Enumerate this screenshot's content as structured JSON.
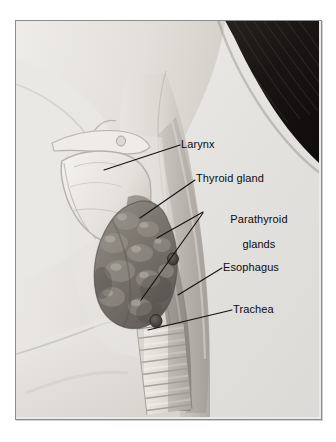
{
  "figure": {
    "kind": "anatomical-illustration",
    "orientation": "profile facing left",
    "style": "grayscale medical illustration",
    "frame": {
      "border_color": "#8a8c8e",
      "background": "#e9eaea"
    },
    "page_background": "#ffffff"
  },
  "palette": {
    "skin_light": "#e6e4e0",
    "skin_mid": "#cfccc6",
    "skin_shadow": "#a8a49d",
    "hair_dark": "#1d1a18",
    "hair_mid": "#3b3531",
    "larynx_light": "#e9e7e2",
    "thyroid_dark": "#6f6a65",
    "thyroid_mid": "#8a857f",
    "trachea_light": "#ddd9d3",
    "esophagus": "#9a958e",
    "leader_line": "#111111",
    "label_text": "#0b0b0b"
  },
  "labels": [
    {
      "id": "larynx",
      "text": "Larynx",
      "lines": [
        "Larynx"
      ],
      "x": 181,
      "y": 138,
      "align": "left",
      "leader": {
        "from": [
          180,
          145
        ],
        "to": [
          104,
          170
        ]
      }
    },
    {
      "id": "thyroid",
      "text": "Thyroid gland",
      "lines": [
        "Thyroid gland"
      ],
      "x": 196,
      "y": 172,
      "align": "left",
      "leader": {
        "from": [
          195,
          180
        ],
        "to": [
          140,
          218
        ]
      }
    },
    {
      "id": "parathyroid",
      "text": "Parathyroid glands",
      "lines": [
        "Parathyroid",
        "glands"
      ],
      "x": 205,
      "y": 200,
      "align": "left",
      "leader": {
        "from": [
          203,
          212
        ],
        "to": [
          157,
          238
        ]
      },
      "leader2": {
        "from": [
          203,
          213
        ],
        "to": [
          141,
          300
        ]
      }
    },
    {
      "id": "esophagus",
      "text": "Esophagus",
      "lines": [
        "Esophagus"
      ],
      "x": 223,
      "y": 261,
      "align": "left",
      "leader": {
        "from": [
          222,
          268
        ],
        "to": [
          178,
          295
        ]
      }
    },
    {
      "id": "trachea",
      "text": "Trachea",
      "lines": [
        "Trachea"
      ],
      "x": 233,
      "y": 303,
      "align": "left",
      "leader": {
        "from": [
          232,
          310
        ],
        "to": [
          148,
          330
        ]
      }
    }
  ],
  "structures": [
    {
      "id": "hair",
      "name": "Hair",
      "region": "upper right"
    },
    {
      "id": "head-neck",
      "name": "Head and neck",
      "region": "center"
    },
    {
      "id": "shoulder",
      "name": "Shoulder",
      "region": "lower left"
    },
    {
      "id": "larynx",
      "name": "Larynx",
      "region": "upper center"
    },
    {
      "id": "hyoid",
      "name": "Hyoid bone",
      "region": "upper center"
    },
    {
      "id": "thyroid",
      "name": "Thyroid gland",
      "region": "center"
    },
    {
      "id": "parathyroid-superior",
      "name": "Superior parathyroid gland",
      "region": "center"
    },
    {
      "id": "parathyroid-inferior",
      "name": "Inferior parathyroid gland",
      "region": "center lower"
    },
    {
      "id": "esophagus",
      "name": "Esophagus",
      "region": "center right"
    },
    {
      "id": "trachea",
      "name": "Trachea",
      "region": "lower center"
    },
    {
      "id": "sternocleidomastoid",
      "name": "Sternocleidomastoid muscle",
      "region": "center right"
    }
  ]
}
